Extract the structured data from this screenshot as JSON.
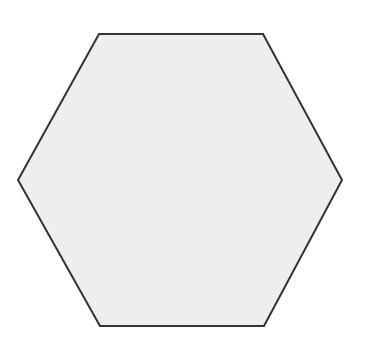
{
  "diagram": {
    "shape": "hexagon",
    "orientation": "flat-top",
    "vertices": [
      [
        99,
        34
      ],
      [
        263,
        34
      ],
      [
        342,
        180
      ],
      [
        264,
        326
      ],
      [
        100,
        326
      ],
      [
        18,
        180
      ]
    ],
    "fill": "#eeeeee",
    "stroke": "#333333",
    "stroke_width": 2
  },
  "background": "#ffffff"
}
